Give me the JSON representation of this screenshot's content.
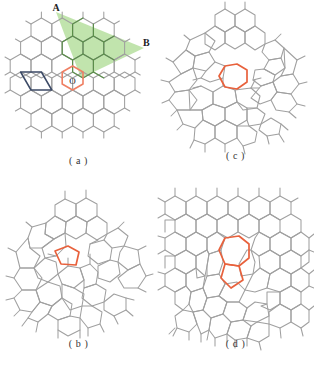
{
  "figure": {
    "type": "scientific-figure",
    "panels": [
      {
        "id": "a",
        "caption": "( a )",
        "description": "pristine honeycomb lattice with primitive unit cell, shaded sector and origin ring",
        "labels": {
          "vector_a": "A",
          "vector_b": "B",
          "origin": "O"
        },
        "highlight_ring": "hexagon",
        "highlight_ring_sides": 6,
        "has_unit_cell": true,
        "has_shaded_sector": true
      },
      {
        "id": "b",
        "caption": "( b )",
        "description": "lattice containing a single five-membered ring defect",
        "labels": {},
        "highlight_ring": "pentagon",
        "highlight_ring_sides": 5,
        "has_unit_cell": false,
        "has_shaded_sector": false
      },
      {
        "id": "c",
        "caption": "( c )",
        "description": "lattice containing a single seven-membered ring defect",
        "labels": {},
        "highlight_ring": "heptagon",
        "highlight_ring_sides": 7,
        "has_unit_cell": false,
        "has_shaded_sector": false
      },
      {
        "id": "d",
        "caption": "( d )",
        "description": "lattice containing a coupled pentagon-heptagon pair defect",
        "labels": {},
        "highlight_ring": "pentagon-heptagon-pair",
        "highlight_ring_sides": "5 + 7",
        "has_unit_cell": false,
        "has_shaded_sector": false
      }
    ],
    "colors": {
      "lattice_line": "#9a9a9a",
      "lattice_line_dark": "#6d6d6d",
      "defect_ring": "#e8613c",
      "origin_ring": "#ef7f63",
      "unit_cell": "#3c4a66",
      "sector_fill": "#a9d98d",
      "sector_line": "#4e8c3a",
      "background": "#ffffff",
      "text": "#2b2b2b"
    }
  }
}
